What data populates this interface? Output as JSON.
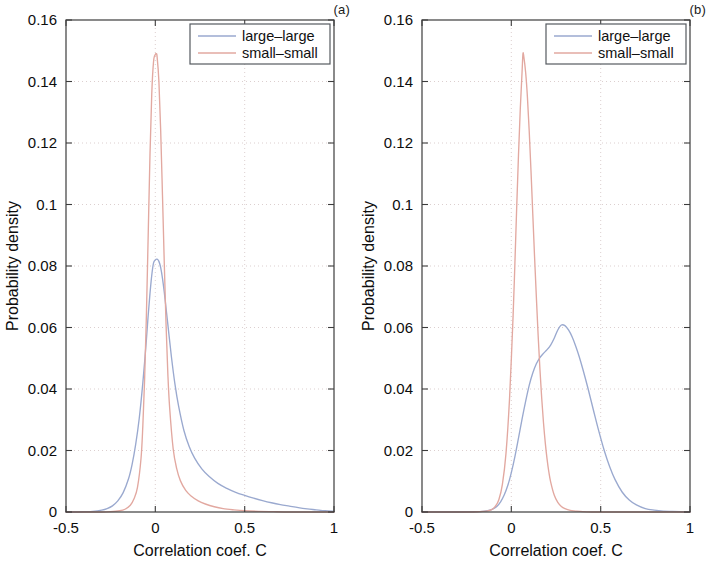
{
  "figure": {
    "panels": [
      {
        "tag": "(a)",
        "xlabel": "Correlation coef. C",
        "ylabel": "Probability density"
      },
      {
        "tag": "(b)",
        "xlabel": "Correlation coef. C",
        "ylabel": "Probability density"
      }
    ],
    "colors": {
      "large_large": "#9aa9cf",
      "small_small": "#e2a8a0",
      "axis": "#3c3c3c",
      "grid": "#d8c9c9",
      "text": "#0d0d0d"
    }
  },
  "chart_data": [
    {
      "type": "line",
      "panel": "(a)",
      "title": "",
      "xlabel": "Correlation coef. C",
      "ylabel": "Probability density",
      "xlim": [
        -0.5,
        1
      ],
      "ylim": [
        0,
        0.16
      ],
      "xticks": [
        -0.5,
        0,
        0.5,
        1
      ],
      "xticklabels": [
        "-0.5",
        "0",
        "0.5",
        "1"
      ],
      "yticks": [
        0,
        0.02,
        0.04,
        0.06,
        0.08,
        0.1,
        0.12,
        0.14,
        0.16
      ],
      "yticklabels": [
        "0",
        "0.02",
        "0.04",
        "0.06",
        "0.08",
        "0.1",
        "0.12",
        "0.14",
        "0.16"
      ],
      "grid": true,
      "legend_position": "upper right",
      "series": [
        {
          "name": "large-large",
          "color": "#9aa9cf",
          "peak_x": 0.01,
          "peak_y": 0.082,
          "x": [
            -0.5,
            -0.45,
            -0.4,
            -0.35,
            -0.3,
            -0.27,
            -0.24,
            -0.21,
            -0.18,
            -0.15,
            -0.13,
            -0.11,
            -0.09,
            -0.07,
            -0.05,
            -0.04,
            -0.03,
            -0.02,
            -0.01,
            0.0,
            0.01,
            0.02,
            0.03,
            0.04,
            0.05,
            0.07,
            0.09,
            0.11,
            0.13,
            0.16,
            0.19,
            0.22,
            0.26,
            0.3,
            0.35,
            0.4,
            0.45,
            0.5,
            0.55,
            0.6,
            0.65,
            0.7,
            0.75,
            0.8,
            0.85,
            0.9,
            0.95,
            1.0
          ],
          "y": [
            0.0,
            0.0,
            0.0001,
            0.0002,
            0.0006,
            0.0011,
            0.002,
            0.0036,
            0.0063,
            0.0108,
            0.0155,
            0.022,
            0.0305,
            0.042,
            0.056,
            0.064,
            0.071,
            0.077,
            0.081,
            0.082,
            0.0822,
            0.0815,
            0.0795,
            0.076,
            0.0715,
            0.061,
            0.0505,
            0.0415,
            0.0345,
            0.0265,
            0.0212,
            0.0175,
            0.014,
            0.0116,
            0.0093,
            0.0077,
            0.0064,
            0.0054,
            0.0045,
            0.0037,
            0.003,
            0.0024,
            0.0019,
            0.0014,
            0.001,
            0.0007,
            0.0004,
            0.0002
          ]
        },
        {
          "name": "small-small",
          "color": "#e2a8a0",
          "peak_x": 0.005,
          "peak_y": 0.149,
          "x": [
            -0.5,
            -0.4,
            -0.3,
            -0.25,
            -0.2,
            -0.17,
            -0.14,
            -0.12,
            -0.1,
            -0.08,
            -0.07,
            -0.06,
            -0.05,
            -0.04,
            -0.03,
            -0.02,
            -0.01,
            0.0,
            0.005,
            0.01,
            0.02,
            0.03,
            0.04,
            0.05,
            0.06,
            0.07,
            0.08,
            0.1,
            0.12,
            0.14,
            0.17,
            0.2,
            0.24,
            0.28,
            0.33,
            0.38,
            0.44,
            0.5,
            0.58,
            0.66,
            0.75,
            0.85,
            1.0
          ],
          "y": [
            0.0,
            0.0,
            0.0,
            0.0001,
            0.0004,
            0.0009,
            0.0022,
            0.0042,
            0.008,
            0.0175,
            0.028,
            0.043,
            0.064,
            0.09,
            0.116,
            0.136,
            0.1465,
            0.1488,
            0.149,
            0.148,
            0.14,
            0.124,
            0.103,
            0.081,
            0.061,
            0.045,
            0.034,
            0.0205,
            0.014,
            0.0102,
            0.007,
            0.0052,
            0.0036,
            0.0026,
            0.0017,
            0.0011,
            0.0007,
            0.0004,
            0.0002,
            0.0001,
            0.0,
            0.0,
            0.0
          ]
        }
      ]
    },
    {
      "type": "line",
      "panel": "(b)",
      "title": "",
      "xlabel": "Correlation coef. C",
      "ylabel": "Probability density",
      "xlim": [
        -0.5,
        1
      ],
      "ylim": [
        0,
        0.16
      ],
      "xticks": [
        -0.5,
        0,
        0.5,
        1
      ],
      "xticklabels": [
        "-0.5",
        "0",
        "0.5",
        "1"
      ],
      "yticks": [
        0,
        0.02,
        0.04,
        0.06,
        0.08,
        0.1,
        0.12,
        0.14,
        0.16
      ],
      "yticklabels": [
        "0",
        "0.02",
        "0.04",
        "0.06",
        "0.08",
        "0.1",
        "0.12",
        "0.14",
        "0.16"
      ],
      "grid": true,
      "legend_position": "upper right",
      "series": [
        {
          "name": "large-large",
          "color": "#9aa9cf",
          "peak_x": 0.28,
          "peak_y": 0.061,
          "x": [
            -0.5,
            -0.3,
            -0.2,
            -0.15,
            -0.12,
            -0.1,
            -0.08,
            -0.06,
            -0.04,
            -0.02,
            0.0,
            0.02,
            0.04,
            0.06,
            0.08,
            0.1,
            0.12,
            0.14,
            0.16,
            0.18,
            0.2,
            0.22,
            0.24,
            0.26,
            0.28,
            0.3,
            0.32,
            0.34,
            0.36,
            0.38,
            0.4,
            0.43,
            0.46,
            0.49,
            0.52,
            0.55,
            0.58,
            0.62,
            0.66,
            0.7,
            0.75,
            0.8,
            0.85,
            0.9,
            0.95,
            1.0
          ],
          "y": [
            0.0,
            0.0,
            0.0001,
            0.0003,
            0.0006,
            0.0011,
            0.0019,
            0.0033,
            0.0055,
            0.0086,
            0.0128,
            0.018,
            0.024,
            0.0302,
            0.036,
            0.0412,
            0.0452,
            0.0482,
            0.0502,
            0.0516,
            0.0528,
            0.0543,
            0.0565,
            0.0592,
            0.0608,
            0.0606,
            0.0592,
            0.057,
            0.054,
            0.0505,
            0.0465,
            0.04,
            0.033,
            0.0262,
            0.02,
            0.0148,
            0.0106,
            0.0065,
            0.0039,
            0.0023,
            0.0011,
            0.0006,
            0.0003,
            0.0002,
            0.0001,
            0.0
          ]
        },
        {
          "name": "small-small",
          "color": "#e2a8a0",
          "peak_x": 0.065,
          "peak_y": 0.149,
          "x": [
            -0.5,
            -0.25,
            -0.18,
            -0.14,
            -0.11,
            -0.09,
            -0.07,
            -0.05,
            -0.03,
            -0.01,
            0.01,
            0.02,
            0.03,
            0.04,
            0.05,
            0.06,
            0.065,
            0.07,
            0.08,
            0.09,
            0.1,
            0.11,
            0.12,
            0.13,
            0.14,
            0.15,
            0.16,
            0.17,
            0.18,
            0.19,
            0.2,
            0.21,
            0.22,
            0.24,
            0.26,
            0.28,
            0.3,
            0.33,
            0.36,
            0.4,
            0.45,
            0.5,
            0.6,
            0.75,
            1.0
          ],
          "y": [
            0.0,
            0.0,
            0.0001,
            0.0003,
            0.0008,
            0.0018,
            0.004,
            0.009,
            0.019,
            0.037,
            0.064,
            0.081,
            0.099,
            0.116,
            0.131,
            0.143,
            0.149,
            0.148,
            0.143,
            0.135,
            0.124,
            0.111,
            0.097,
            0.083,
            0.07,
            0.0575,
            0.0465,
            0.037,
            0.029,
            0.0225,
            0.0172,
            0.013,
            0.0098,
            0.0055,
            0.0031,
            0.0018,
            0.0011,
            0.0005,
            0.0003,
            0.0001,
            0.0,
            0.0,
            0.0,
            0.0,
            0.0
          ]
        }
      ]
    }
  ],
  "legend": {
    "items": [
      {
        "label": "large–large",
        "color": "#9aa9cf"
      },
      {
        "label": "small–small",
        "color": "#e2a8a0"
      }
    ]
  }
}
